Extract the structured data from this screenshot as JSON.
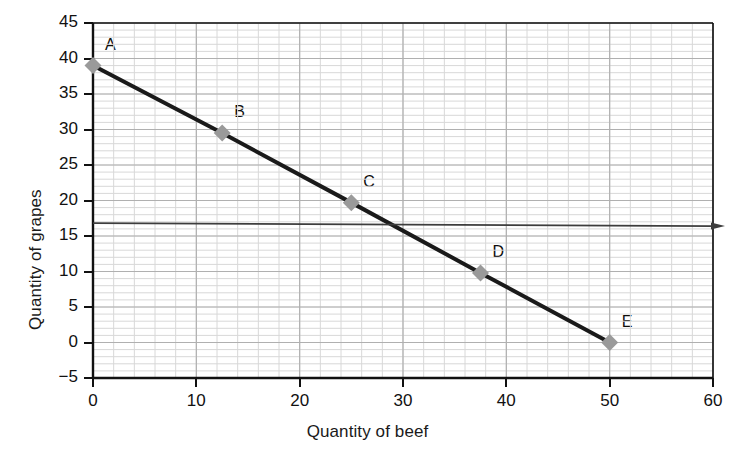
{
  "chart_data": {
    "type": "line",
    "title": "",
    "xlabel": "Quantity of beef",
    "ylabel": "Quantity of grapes",
    "xlim": [
      0,
      60
    ],
    "ylim": [
      -5,
      45
    ],
    "xticks": [
      0,
      10,
      20,
      30,
      40,
      50,
      60
    ],
    "yticks": [
      -5,
      0,
      5,
      10,
      15,
      20,
      25,
      30,
      35,
      40,
      45
    ],
    "xtick_labels": [
      "0",
      "10",
      "20",
      "30",
      "40",
      "50",
      "60"
    ],
    "ytick_labels": [
      "−5",
      "0",
      "5",
      "10",
      "15",
      "20",
      "25",
      "30",
      "35",
      "40",
      "45"
    ],
    "grid": true,
    "grid_minor_x_step": 2,
    "grid_minor_y_step": 1,
    "grid_major_x_step": 10,
    "grid_major_y_step": 5,
    "legend": null,
    "series": [
      {
        "name": "budget-line",
        "type": "line",
        "color": "#1a1a1a",
        "marker": "diamond",
        "marker_color": "#9a9a9a",
        "x": [
          0,
          12.5,
          25,
          37.5,
          50
        ],
        "y": [
          39,
          29.5,
          19.7,
          9.8,
          0
        ],
        "point_labels": [
          "A",
          "B",
          "C",
          "D",
          "E"
        ]
      },
      {
        "name": "reference-line",
        "type": "hline",
        "color": "#3d3d3d",
        "y_start": 16.8,
        "y_end": 16.4,
        "x_start": 0,
        "x_end": 60,
        "has_arrow_tip": true
      }
    ],
    "points": [
      {
        "label": "A",
        "x": 0,
        "y": 39
      },
      {
        "label": "B",
        "x": 12.5,
        "y": 29.5
      },
      {
        "label": "C",
        "x": 25,
        "y": 19.7
      },
      {
        "label": "D",
        "x": 37.5,
        "y": 9.8
      },
      {
        "label": "E",
        "x": 50,
        "y": 0
      }
    ],
    "colors": {
      "line": "#1a1a1a",
      "marker": "#9a9a9a",
      "grid_minor": "#d8d8d8",
      "grid_major": "#b0b0b0",
      "axis": "#111111",
      "background": "#ffffff"
    }
  }
}
